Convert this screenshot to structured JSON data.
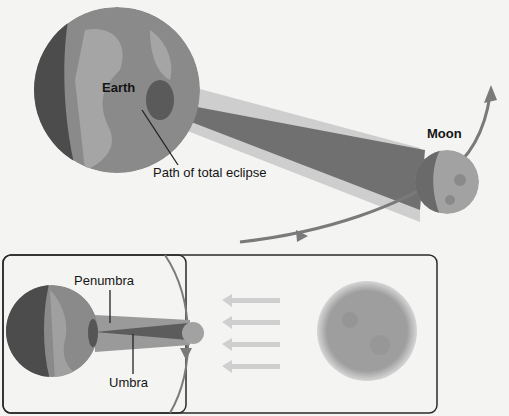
{
  "diagram": {
    "labels": {
      "earth": "Earth",
      "moon": "Moon",
      "path": "Path of total eclipse",
      "penumbra": "Penumbra",
      "umbra": "Umbra"
    },
    "colors": {
      "background": "#f4f4f3",
      "earth_day": "#8c8c8c",
      "earth_land": "#a8a8a8",
      "earth_night": "#4e4e4e",
      "shadow_umbra": "#6a6a6a",
      "shadow_penumbra": "#9a9a9a",
      "orbit": "#7a7a7a",
      "moon": "#9c9c9c",
      "sun_rays": "#cfcfcf",
      "inset_border": "#2a2a2a"
    }
  }
}
